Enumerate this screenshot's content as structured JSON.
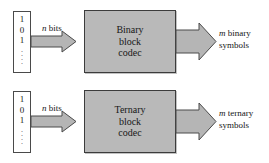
{
  "diagram": {
    "type": "block-diagram",
    "background_color": "#ffffff",
    "box_fill_color": "#b9b9b9",
    "arrow_fill_color": "#b5b5b5",
    "outline_color": "#3c3c3c",
    "rows": [
      {
        "id": "binary",
        "input_stream": {
          "digits": [
            "1",
            "0",
            "1"
          ],
          "continuation": "vertical-dots"
        },
        "input_arrow_label": {
          "symbol": "n",
          "text": "bits"
        },
        "block": {
          "lines": [
            "Binary",
            "block",
            "codec"
          ]
        },
        "output_label": {
          "symbol": "m",
          "line1": "binary",
          "line2": "symbols"
        }
      },
      {
        "id": "ternary",
        "input_stream": {
          "digits": [
            "1",
            "0",
            "1"
          ],
          "continuation": "vertical-dots"
        },
        "input_arrow_label": {
          "symbol": "n",
          "text": "bits"
        },
        "block": {
          "lines": [
            "Ternary",
            "block",
            "codec"
          ]
        },
        "output_label": {
          "symbol": "m",
          "line1": "ternary",
          "line2": "symbols"
        }
      }
    ]
  }
}
